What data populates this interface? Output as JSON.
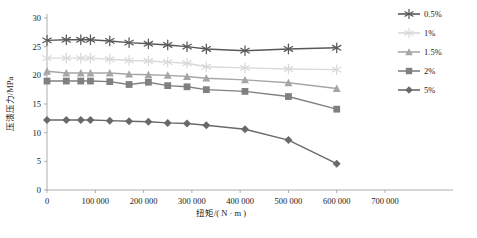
{
  "chart_data": {
    "type": "line",
    "title": "",
    "xlabel": "扭矩/( N · m )",
    "ylabel": "压溃压力/MPa",
    "xlim": [
      0,
      700000
    ],
    "ylim": [
      0,
      30
    ],
    "xticks": [
      0,
      100000,
      200000,
      300000,
      400000,
      500000,
      600000,
      700000
    ],
    "xtick_labels": [
      "0",
      "100 000",
      "200 000",
      "300 000",
      "400 000",
      "500 000",
      "600 000",
      "700 000"
    ],
    "yticks": [
      0,
      5,
      10,
      15,
      20,
      25,
      30
    ],
    "ytick_labels": [
      "0",
      "5",
      "10",
      "15",
      "20",
      "25",
      "30"
    ],
    "grid": false,
    "legend_position": "right",
    "x": [
      0,
      40000,
      70000,
      90000,
      130000,
      170000,
      210000,
      250000,
      290000,
      330000,
      410000,
      500000,
      600000
    ],
    "series": [
      {
        "name": "0.5%",
        "color": "#595959",
        "marker": "asterisk",
        "values": [
          26.1,
          26.2,
          26.2,
          26.2,
          26.0,
          25.7,
          25.5,
          25.3,
          25.0,
          24.6,
          24.3,
          24.6,
          24.8
        ]
      },
      {
        "name": "1%",
        "color": "#d9d9d9",
        "marker": "asterisk",
        "values": [
          23.0,
          23.0,
          23.0,
          23.0,
          22.8,
          22.6,
          22.5,
          22.3,
          22.1,
          21.5,
          21.3,
          21.1,
          21.0
        ]
      },
      {
        "name": "1.5%",
        "color": "#a6a6a6",
        "marker": "triangle",
        "values": [
          20.7,
          20.4,
          20.4,
          20.4,
          20.4,
          20.2,
          20.1,
          20.0,
          19.8,
          19.5,
          19.2,
          18.7,
          17.7
        ]
      },
      {
        "name": "2%",
        "color": "#808080",
        "marker": "square",
        "values": [
          19.0,
          19.0,
          19.0,
          19.0,
          18.9,
          18.4,
          18.8,
          18.2,
          18.0,
          17.5,
          17.2,
          16.3,
          14.1
        ]
      },
      {
        "name": "5%",
        "color": "#696969",
        "marker": "diamond",
        "values": [
          12.2,
          12.2,
          12.2,
          12.2,
          12.1,
          12.0,
          11.9,
          11.7,
          11.6,
          11.3,
          10.6,
          8.7,
          4.6
        ]
      }
    ]
  }
}
